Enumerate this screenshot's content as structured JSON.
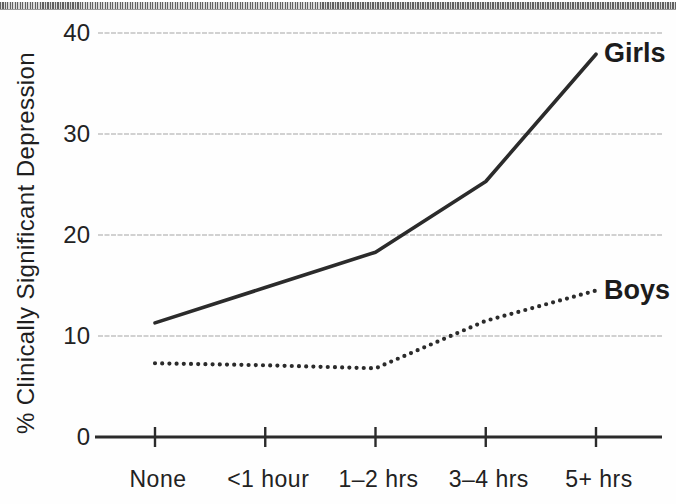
{
  "figure": {
    "description_colors": {
      "line_color": "#2b2b2b",
      "grid_color": "#c2c2c2",
      "axis_color": "#2b2b2b",
      "text_color": "#222222",
      "background": "#fefefe"
    }
  },
  "chart_data": {
    "type": "line",
    "title": "",
    "xlabel": "",
    "ylabel": "% Clinically Significant Depression",
    "categories": [
      "None",
      "<1 hour",
      "1–2 hrs",
      "3–4 hrs",
      "5+ hrs"
    ],
    "series": [
      {
        "name": "Girls",
        "style": "solid",
        "values": [
          11.3,
          14.8,
          18.3,
          25.3,
          37.9
        ]
      },
      {
        "name": "Boys",
        "style": "dotted",
        "values": [
          7.3,
          7.1,
          6.8,
          11.5,
          14.5
        ]
      }
    ],
    "yticks": [
      0,
      10,
      20,
      30,
      40
    ],
    "ylim": [
      0,
      42
    ],
    "grid": "horizontal",
    "legend_position": "labels-at-line-ends"
  }
}
